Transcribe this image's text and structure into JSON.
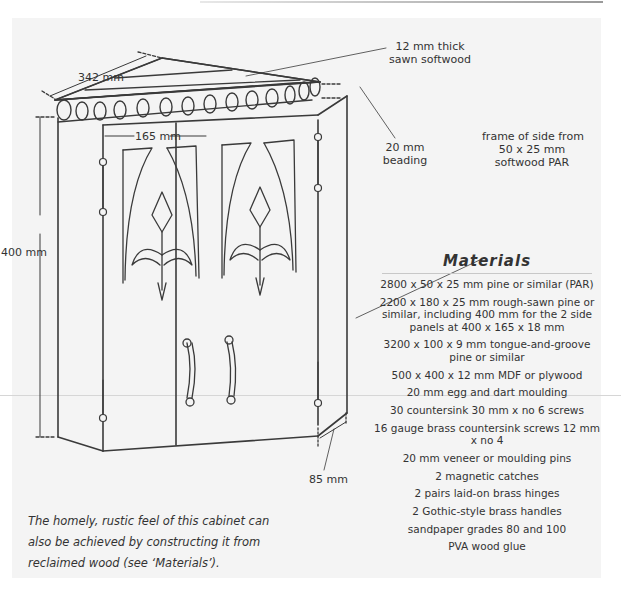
{
  "figure": {
    "labels": {
      "top_depth": "342 mm",
      "top_material_line1": "12 mm thick",
      "top_material_line2": "sawn softwood",
      "beading_line1": "20 mm",
      "beading_line2": "beading",
      "frame_line1": "frame of side from",
      "frame_line2": "50 x 25 mm",
      "frame_line3": "softwood PAR",
      "door_width": "165 mm",
      "height": "400 mm",
      "side_width": "85 mm"
    }
  },
  "materials": {
    "heading": "Materials",
    "items": [
      "2800 x 50 x 25 mm pine or similar (PAR)",
      "2200 x 180 x 25 mm rough-sawn pine or similar, including 400 mm for the 2 side panels at 400 x 165 x 18 mm",
      "3200 x 100 x 9 mm tongue-and-groove pine or similar",
      "500 x 400 x 12 mm MDF or plywood",
      "20 mm egg and dart moulding",
      "30 countersink 30 mm x no 6 screws",
      "16 gauge brass countersink screws 12 mm x no 4",
      "20 mm veneer or moulding pins",
      "2 magnetic catches",
      "2 pairs laid-on brass hinges",
      "2 Gothic-style brass handles",
      "sandpaper grades 80 and 100",
      "PVA wood glue"
    ]
  },
  "caption": "The homely, rustic feel of this cabinet can also be achieved by constructing it from reclaimed wood (see ‘Materials’).",
  "colors": {
    "panel": "#f4f4f4",
    "ink": "#3a3a3a"
  }
}
